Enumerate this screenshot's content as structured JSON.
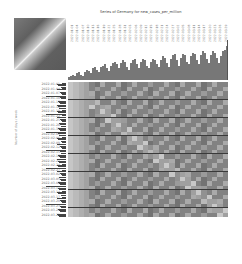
{
  "chart_data": {
    "type": "heatmap",
    "title": "Series of Germany for new_cases_per_million",
    "xlabel": "",
    "ylabel": "Number of days / week",
    "row_labels": [
      "2022-01-01",
      "2022-01-04",
      "2022-01-07",
      "2022-01-10",
      "2022-01-13",
      "2022-01-16",
      "2022-01-19",
      "2022-01-22",
      "2022-01-25",
      "2022-01-28",
      "2022-01-31",
      "2022-02-03",
      "2022-02-06",
      "2022-02-09",
      "2022-02-12",
      "2022-02-15",
      "2022-02-18",
      "2022-02-21",
      "2022-02-24",
      "2022-02-27",
      "2022-03-02",
      "2022-03-05",
      "2022-03-08",
      "2022-03-11",
      "2022-03-14",
      "2022-03-17",
      "2022-03-20",
      "2022-03-23",
      "2022-03-26",
      "2022-03-29"
    ],
    "col_labels": [
      "2022-01-01",
      "2022-01-04",
      "2022-01-07",
      "2022-01-10",
      "2022-01-13",
      "2022-01-16",
      "2022-01-19",
      "2022-01-22",
      "2022-01-25",
      "2022-01-28",
      "2022-01-31",
      "2022-02-03",
      "2022-02-06",
      "2022-02-09",
      "2022-02-12",
      "2022-02-15",
      "2022-02-18",
      "2022-02-21",
      "2022-02-24",
      "2022-02-27",
      "2022-03-02",
      "2022-03-05",
      "2022-03-08",
      "2022-03-11",
      "2022-03-14",
      "2022-03-17",
      "2022-03-20",
      "2022-03-23",
      "2022-03-26",
      "2022-03-29"
    ],
    "top_bar_values": [
      2,
      3,
      4,
      3,
      5,
      6,
      4,
      3,
      6,
      8,
      7,
      5,
      9,
      10,
      8,
      6,
      10,
      11,
      12,
      9,
      7,
      11,
      13,
      14,
      12,
      9,
      13,
      15,
      14,
      10,
      8,
      13,
      15,
      16,
      12,
      9,
      14,
      16,
      15,
      11,
      9,
      14,
      16,
      15,
      12,
      10,
      15,
      18,
      17,
      13,
      10,
      16,
      19,
      20,
      15,
      11,
      17,
      20,
      19,
      14,
      12,
      18,
      21,
      20,
      15,
      12,
      19,
      22,
      21,
      16,
      13,
      19,
      22,
      21,
      17,
      13,
      18,
      22,
      23,
      26
    ],
    "separator_every_rows": 4,
    "cmap": "grayscale",
    "grid": false
  },
  "colors": {
    "bar": "#777777",
    "separator": "#3a3a3a",
    "text": "#777777"
  }
}
